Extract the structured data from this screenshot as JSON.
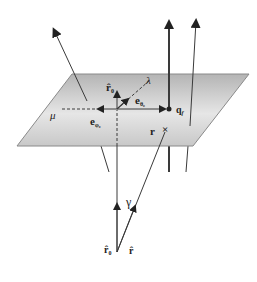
{
  "diagram": {
    "labels": {
      "r0_hat_top": "r̂",
      "r0_hat_top_sub": "0",
      "lambda": "λ",
      "e_theta": "e",
      "e_theta_sub": "θ₀",
      "e_phi": "e",
      "e_phi_sub": "φ₀",
      "mu": "μ",
      "qf": "q",
      "qf_sub": "f",
      "r": "r",
      "r_marker": "×",
      "gamma": "γ",
      "r0_hat_bottom": "r̂",
      "r0_hat_bottom_sub": "0",
      "r_hat": "r̂"
    },
    "colors": {
      "line": "#3a3a3a",
      "plane_top": "#b8b8b8",
      "plane_bottom": "#f2f2f2",
      "plane_edge": "#8a8a8a"
    }
  }
}
